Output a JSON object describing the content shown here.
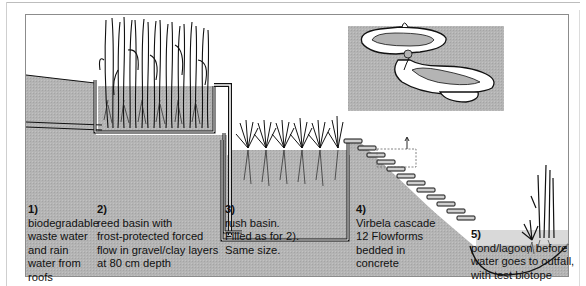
{
  "diagram": {
    "colors": {
      "ground": "#b4b4b4",
      "ground_dark": "#a8a8a8",
      "sky": "#ffffff",
      "line": "#111111",
      "pipe": "#ffffff",
      "frame": "#8c8c8c"
    },
    "stages": [
      {
        "number": "1)",
        "lines": [
          "biodegradable",
          "waste water",
          "and rain",
          "water from",
          "roofs"
        ]
      },
      {
        "number": "2)",
        "lines": [
          "reed basin with",
          "frost-protected forced",
          "flow in gravel/clay layers",
          "at 80 cm depth"
        ]
      },
      {
        "number": "3)",
        "lines": [
          "rush basin.",
          "Filled as for 2).",
          "Same size."
        ]
      },
      {
        "number": "4)",
        "lines": [
          "Virbela cascade",
          "12 Flowforms",
          "bedded in",
          "concrete"
        ]
      },
      {
        "number": "5)",
        "lines": [
          "pond/lagoon before",
          "water goes to outfall,",
          "with test biotope"
        ]
      }
    ],
    "inset": {
      "name": "flowform-detail",
      "description": "Flowform vessel detail"
    },
    "flowform_count": 12
  }
}
